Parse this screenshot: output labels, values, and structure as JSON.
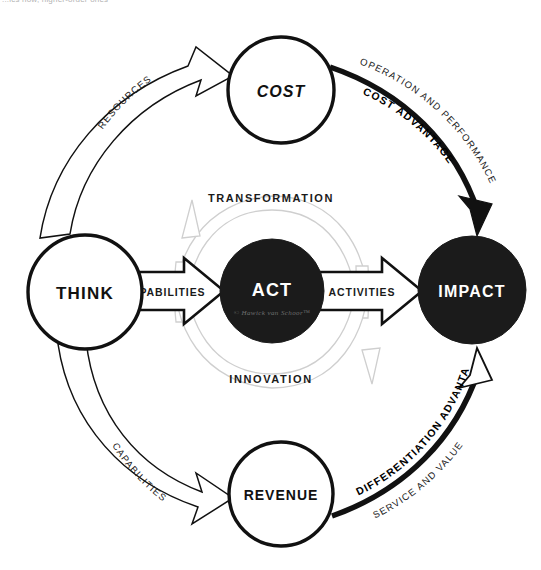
{
  "page": {
    "width": 541,
    "height": 570,
    "background": "#ffffff",
    "clipped_header_text": "...ics now, higher-order ones"
  },
  "colors": {
    "stroke_dark": "#111111",
    "fill_black": "#1b1b1b",
    "fill_white": "#ffffff",
    "inner_arc_gray": "#c9c9c9",
    "curve_text": "#1a1a1a"
  },
  "nodes": [
    {
      "id": "think",
      "label": "THINK",
      "style": "outline",
      "cx": 85,
      "cy": 292,
      "r": 57,
      "font_size": 17
    },
    {
      "id": "cost",
      "label": "COST",
      "style": "outline",
      "cx": 281,
      "cy": 90,
      "r": 53,
      "font_size": 16
    },
    {
      "id": "act",
      "label": "ACT",
      "style": "filled",
      "cx": 272,
      "cy": 291,
      "r": 52,
      "font_size": 18,
      "signature": "© Hawick van Schoor™"
    },
    {
      "id": "revenue",
      "label": "REVENUE",
      "style": "outline",
      "cx": 281,
      "cy": 494,
      "r": 52,
      "font_size": 14
    },
    {
      "id": "impact",
      "label": "IMPACT",
      "style": "filled",
      "cx": 472,
      "cy": 290,
      "r": 54,
      "font_size": 16
    }
  ],
  "flow_arrows": [
    {
      "id": "think-to-cost",
      "label": "RESOURCES",
      "style": "hollow-curved",
      "from": "think",
      "to": "cost"
    },
    {
      "id": "think-to-revenue",
      "label": "CAPABILITIES",
      "style": "hollow-curved",
      "from": "think",
      "to": "revenue"
    },
    {
      "id": "cost-to-impact",
      "label": "COST ADVANTAGE",
      "outer_label": "OPERATION AND PERFORMANCE",
      "style": "solid-curved",
      "from": "cost",
      "to": "impact"
    },
    {
      "id": "revenue-to-impact",
      "label": "DIFFERENTIATION ADVANTAGE",
      "outer_label": "SERVICE AND VALUE",
      "style": "solid-curved",
      "from": "revenue",
      "to": "impact"
    },
    {
      "id": "think-to-act",
      "label": "CAPABILITIES",
      "style": "hollow-block",
      "from": "think",
      "to": "act"
    },
    {
      "id": "act-to-impact",
      "label": "ACTIVITIES",
      "style": "hollow-block",
      "from": "act",
      "to": "impact"
    }
  ],
  "inner_arcs": [
    {
      "id": "transformation",
      "label": "TRANSFORMATION",
      "position": "top"
    },
    {
      "id": "innovation",
      "label": "INNOVATION",
      "position": "bottom"
    }
  ]
}
